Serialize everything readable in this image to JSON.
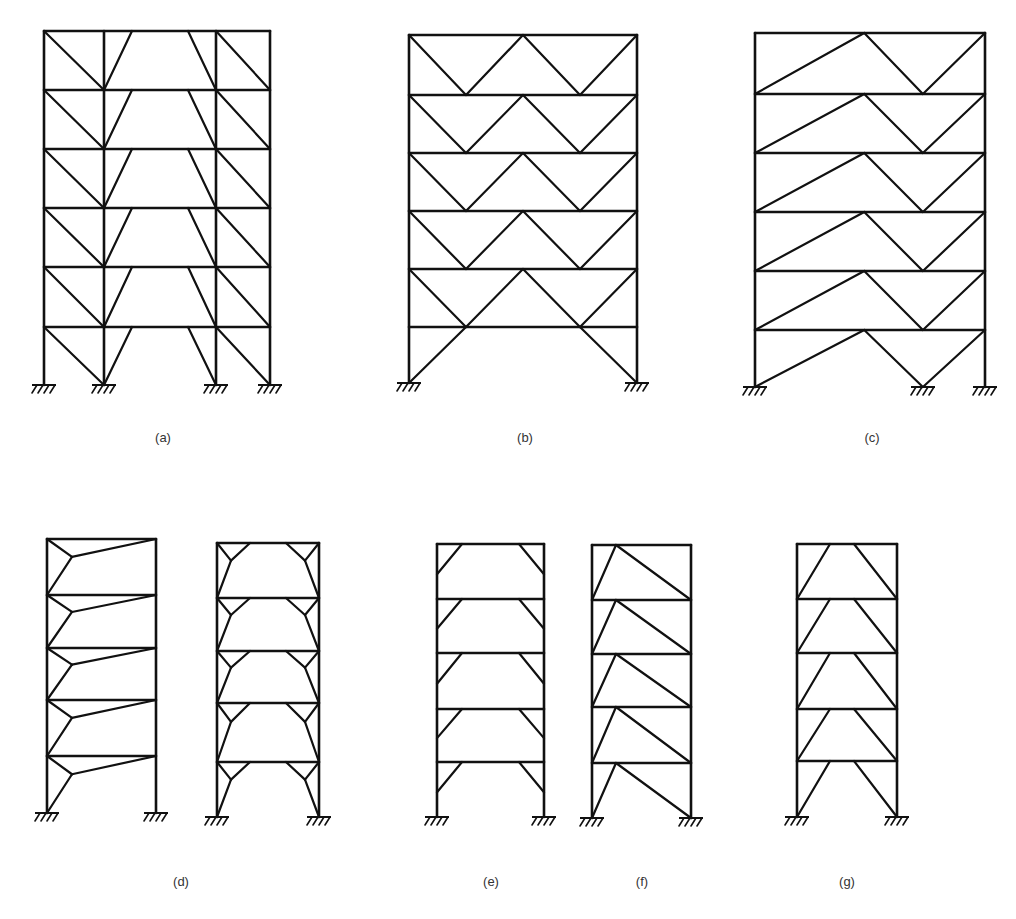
{
  "figure": {
    "style": {
      "line_color": "#111111",
      "background": "#ffffff",
      "label_color": "#333333"
    },
    "panels": [
      {
        "id": "a",
        "label": "(a)",
        "label_pos": [
          163,
          438
        ],
        "columns": [
          44,
          104,
          216,
          270
        ],
        "floors": [
          31,
          90,
          149,
          208,
          267,
          327
        ],
        "base": 385,
        "supports": [
          44,
          104,
          216,
          270
        ],
        "bracing": "Eccentric braces: diagonals in outer bays, knee braces into central bay"
      },
      {
        "id": "b",
        "label": "(b)",
        "label_pos": [
          525,
          438
        ],
        "columns": [
          409,
          637
        ],
        "floors": [
          35,
          95,
          153,
          211,
          269,
          327
        ],
        "base": 383,
        "supports": [
          409,
          637
        ],
        "bracing": "Double chevron (W) bracing per storey, X-pattern ground storey"
      },
      {
        "id": "c",
        "label": "(c)",
        "label_pos": [
          872,
          438
        ],
        "columns": [
          755,
          985
        ],
        "floors": [
          33,
          94,
          153,
          212,
          271,
          330
        ],
        "base": 387,
        "supports": [
          755,
          923,
          985
        ],
        "bracing": "Asymmetric chevron bracing with long diagonal"
      },
      {
        "id": "d",
        "label": "(d)",
        "label_pos": [
          181,
          882
        ],
        "sub_frames": [
          {
            "columns": [
              47,
              156
            ],
            "floors": [
              539,
              595,
              648,
              700,
              756
            ],
            "base": 813,
            "bracing": "Y-braces with link to opposite corner"
          },
          {
            "columns": [
              217,
              319
            ],
            "floors": [
              543,
              598,
              651,
              703,
              762
            ],
            "base": 817,
            "bracing": "Double Y-braces (knee-link) per storey"
          }
        ]
      },
      {
        "id": "e",
        "label": "(e)",
        "label_pos": [
          491,
          882
        ],
        "columns": [
          437,
          544
        ],
        "floors": [
          544,
          599,
          653,
          709,
          762
        ],
        "base": 817,
        "bracing": "Knee braces at beam-column corners"
      },
      {
        "id": "f",
        "label": "(f)",
        "label_pos": [
          642,
          882
        ],
        "columns": [
          592,
          691
        ],
        "floors": [
          545,
          600,
          654,
          707,
          763
        ],
        "base": 818,
        "bracing": "Eccentric single-diagonal with short link"
      },
      {
        "id": "g",
        "label": "(g)",
        "label_pos": [
          847,
          882
        ],
        "columns": [
          797,
          897
        ],
        "floors": [
          544,
          599,
          653,
          709,
          761
        ],
        "base": 817,
        "bracing": "Split-K / inverted-V eccentric bracing"
      }
    ]
  }
}
